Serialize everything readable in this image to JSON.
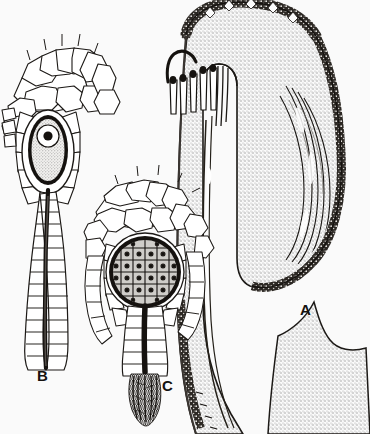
{
  "plate": {
    "title": "Archegonium, antheridium and gametophore apex",
    "background_color": "#fafafa",
    "ink_color": "#15120f",
    "stipple_color": "#d8d8d8",
    "mid_gray": "#b9b9b9"
  },
  "figures": [
    {
      "id": "A",
      "label": "A",
      "name": "gametophore-apex-longitudinal-section",
      "label_x": 300,
      "label_y": 315,
      "description": "Hooked apex in longitudinal section, stippled ground tissue with dark papillate epidermis and pendent paraphyses"
    },
    {
      "id": "B",
      "label": "B",
      "name": "archegonium",
      "label_x": 37,
      "label_y": 381,
      "description": "Archegonium with venter containing egg cell and nucleus, long neck with dark canal"
    },
    {
      "id": "C",
      "label": "C",
      "name": "antheridium",
      "label_x": 162,
      "label_y": 391,
      "description": "Antheridium with spermatogenous cell mass in jacket, stalk with discharged sperm"
    }
  ]
}
